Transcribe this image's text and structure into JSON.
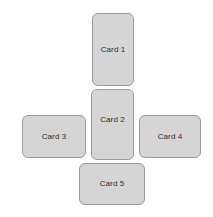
{
  "diagram": {
    "type": "cross-layout-card-diagram",
    "background_color": "#ffffff",
    "card_fill_color": "#d5d5d5",
    "card_border_color": "#9a9a9a",
    "label_color": "#2b2b2b",
    "cards": [
      {
        "id": "card-1",
        "label": "Card 1",
        "position": "top",
        "orientation": "vertical",
        "x": 92,
        "y": 13,
        "width": 42,
        "height": 73
      },
      {
        "id": "card-2",
        "label": "Card 2",
        "position": "center",
        "orientation": "vertical",
        "x": 91,
        "y": 89,
        "width": 43,
        "height": 71
      },
      {
        "id": "card-3",
        "label": "Card 3",
        "position": "left",
        "orientation": "horizontal",
        "x": 22,
        "y": 115,
        "width": 64,
        "height": 43
      },
      {
        "id": "card-4",
        "label": "Card 4",
        "position": "right",
        "orientation": "horizontal",
        "x": 139,
        "y": 115,
        "width": 62,
        "height": 43
      },
      {
        "id": "card-5",
        "label": "Card 5",
        "position": "bottom",
        "orientation": "horizontal",
        "x": 79,
        "y": 163,
        "width": 66,
        "height": 42
      }
    ]
  }
}
